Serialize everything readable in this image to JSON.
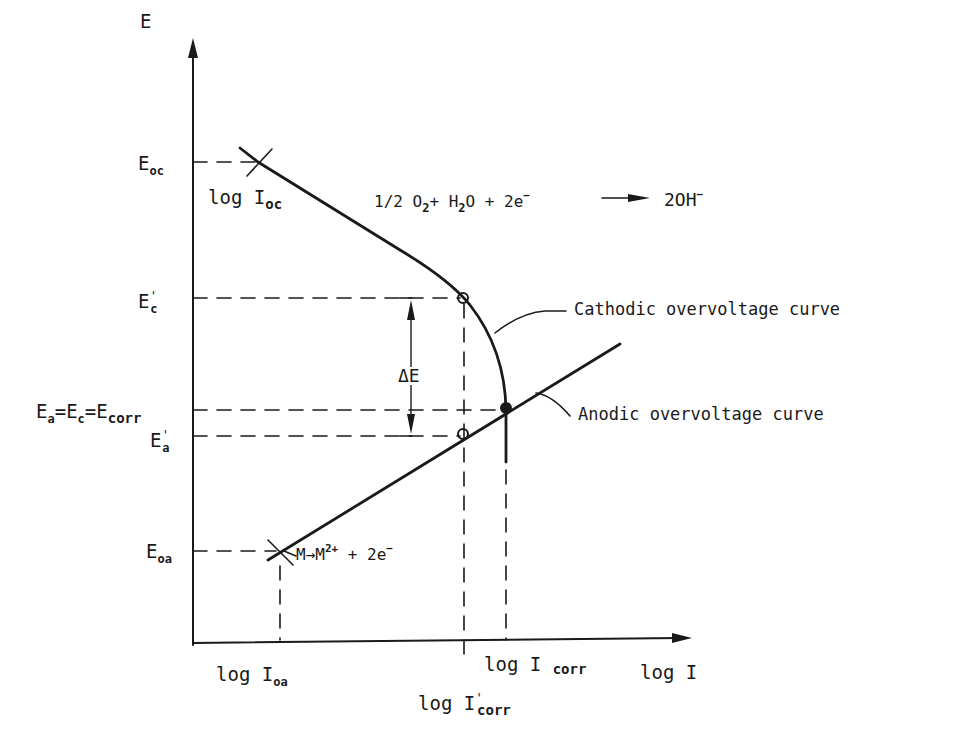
{
  "diagram": {
    "axes": {
      "y_label": "E",
      "x_label": "log I"
    },
    "y_ticks": {
      "E_oc": {
        "main": "E",
        "sub": "oc"
      },
      "E_c_prime": {
        "main": "E",
        "prime": "'",
        "sub": "c"
      },
      "E_corr": {
        "a_main": "E",
        "a_sub": "a",
        "eq1": "=",
        "c_main": "E",
        "c_sub": "c",
        "eq2": "=",
        "corr_main": "E",
        "corr_sub": "corr"
      },
      "E_a_prime": {
        "main": "E",
        "prime": "'",
        "sub": "a"
      },
      "E_oa": {
        "main": "E",
        "sub": "oa"
      }
    },
    "x_ticks": {
      "log_I_oa": {
        "main": "log I",
        "sub": "oa"
      },
      "log_I_corr": {
        "main": "log I",
        "sub": "corr"
      },
      "log_I_corr_prime": {
        "main": "log I",
        "prime": "'",
        "sub": "corr"
      }
    },
    "annotations": {
      "log_I_oc": {
        "main": "log I",
        "sub": "oc"
      },
      "cathodic_reaction": {
        "p1": "1/2 O",
        "s1": "2",
        "p2": "+ H",
        "s2": "2",
        "p3": "O + 2e",
        "sup1": "−",
        "arrow": "—►",
        "p4": "2OH",
        "sup2": "−"
      },
      "anodic_reaction": {
        "p1": "M",
        "arrow": "→",
        "p2": "M",
        "sup1": "2+",
        "p3": " + 2e",
        "sup2": "−"
      },
      "delta_E": "ΔE",
      "cathodic_curve_label": "Cathodic overvoltage curve",
      "anodic_curve_label": "Anodic overvoltage curve"
    },
    "colors": {
      "ink": "#1a1a1a",
      "background": "#ffffff"
    }
  }
}
